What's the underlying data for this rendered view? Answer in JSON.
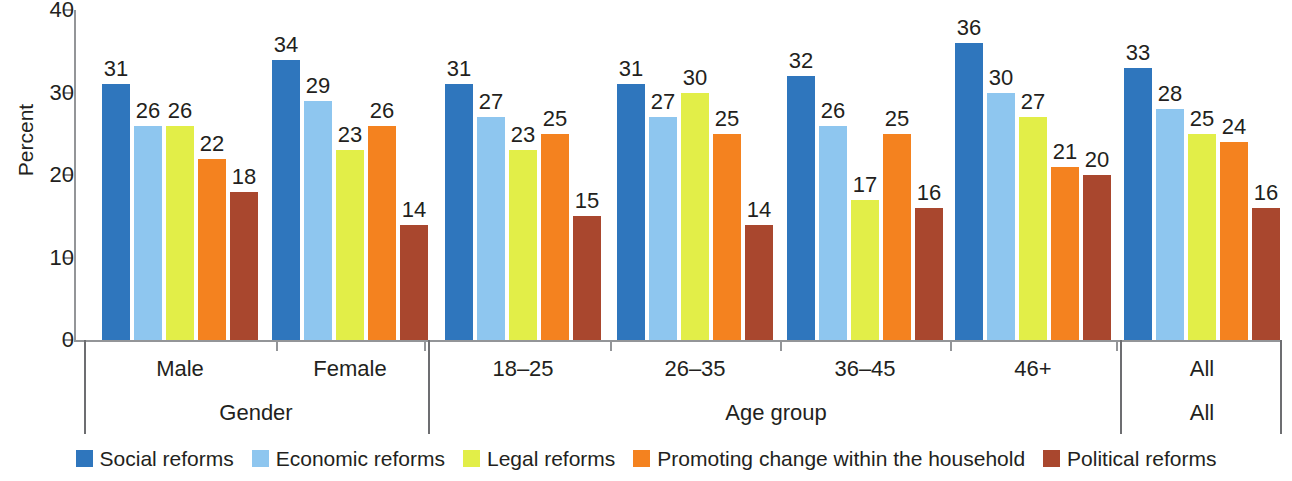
{
  "chart_data": {
    "type": "bar",
    "title": "",
    "xlabel": "",
    "ylabel": "Percent",
    "ylim": [
      0,
      40
    ],
    "yticks": [
      0,
      10,
      20,
      30,
      40
    ],
    "grid": false,
    "legend_position": "bottom",
    "categories": [
      "Male",
      "Female",
      "18–25",
      "26–35",
      "36–45",
      "46+",
      "All"
    ],
    "supergroups": [
      {
        "label": "Gender",
        "categories": [
          "Male",
          "Female"
        ]
      },
      {
        "label": "Age group",
        "categories": [
          "18–25",
          "26–35",
          "36–45",
          "46+"
        ]
      },
      {
        "label": "All",
        "categories": [
          "All"
        ]
      }
    ],
    "series": [
      {
        "name": "Social reforms",
        "color": "#2f76bd",
        "values": [
          31,
          34,
          31,
          31,
          32,
          36,
          33
        ]
      },
      {
        "name": "Economic reforms",
        "color": "#8ec6ef",
        "values": [
          26,
          29,
          27,
          27,
          26,
          30,
          28
        ]
      },
      {
        "name": "Legal reforms",
        "color": "#e2ee48",
        "values": [
          26,
          23,
          23,
          30,
          17,
          27,
          25
        ]
      },
      {
        "name": "Promoting change within the household",
        "color": "#f4821f",
        "values": [
          22,
          26,
          25,
          25,
          25,
          21,
          24
        ]
      },
      {
        "name": "Political reforms",
        "color": "#a9472e",
        "values": [
          18,
          14,
          15,
          14,
          16,
          20,
          16
        ]
      }
    ]
  },
  "legend": {
    "items": [
      {
        "label": "Social reforms",
        "color": "#2f76bd"
      },
      {
        "label": "Economic reforms",
        "color": "#8ec6ef"
      },
      {
        "label": "Legal reforms",
        "color": "#e2ee48"
      },
      {
        "label": "Promoting change within the household",
        "color": "#f4821f"
      },
      {
        "label": "Political reforms",
        "color": "#a9472e"
      }
    ]
  },
  "axis": {
    "y_title": "Percent",
    "y_tick_labels": [
      "40",
      "30",
      "20",
      "10",
      "0"
    ]
  }
}
